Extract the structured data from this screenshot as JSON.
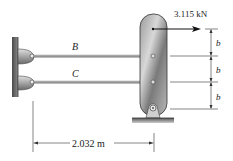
{
  "figure": {
    "force": {
      "value_label": "3.115 kN",
      "direction": "right"
    },
    "rods": [
      {
        "label": "B"
      },
      {
        "label": "C"
      }
    ],
    "spacing": [
      {
        "label": "b"
      },
      {
        "label": "b"
      },
      {
        "label": "b"
      }
    ],
    "horizontal_dimension": {
      "label": "2.032 m"
    },
    "colors": {
      "wall": "#6f6f6f",
      "post": "#8a8a8a",
      "rod": "#9a9a9a",
      "lines": "#333333"
    }
  }
}
